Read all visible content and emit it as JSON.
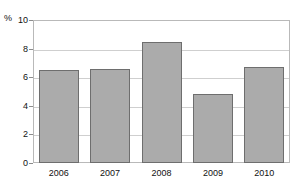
{
  "chart_data": {
    "type": "bar",
    "title": "",
    "subtitle": "",
    "xlabel": "",
    "ylabel": "%",
    "unit_label": "%",
    "categories": [
      "2006",
      "2007",
      "2008",
      "2009",
      "2010"
    ],
    "values": [
      6.5,
      6.55,
      8.45,
      4.8,
      6.7
    ],
    "series": [
      {
        "name": "",
        "values": [
          6.5,
          6.55,
          8.45,
          4.8,
          6.7
        ]
      }
    ],
    "ylim": [
      0,
      10
    ],
    "yticks": [
      0,
      2,
      4,
      6,
      8,
      10
    ],
    "ytick_labels": [
      "0",
      "2",
      "4",
      "6",
      "8",
      "10"
    ],
    "grid": true,
    "grid_axis": "y",
    "legend": false,
    "legend_position": "none",
    "bar_color": "#ababab",
    "bar_border_color": "#6e6e6e",
    "grid_color": "#cfcfcf",
    "frame_color": "#b9b9b9",
    "text_color": "#111111"
  }
}
